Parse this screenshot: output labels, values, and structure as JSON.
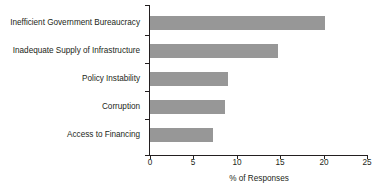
{
  "chart_data": {
    "type": "bar",
    "orientation": "horizontal",
    "title": "",
    "subtitle": "",
    "xlabel": "% of Responses",
    "ylabel": "",
    "xlim": [
      0,
      25
    ],
    "xticks": [
      0,
      5,
      10,
      15,
      20,
      25
    ],
    "xticklabels": [
      "0",
      "5",
      "10",
      "15",
      "20",
      "25"
    ],
    "grid": false,
    "legend": false,
    "categories": [
      "Inefficient Government Bureaucracy",
      "Inadequate Supply of Infrastructure",
      "Policy Instability",
      "Corruption",
      "Access to Financing"
    ],
    "values": [
      20.1,
      14.7,
      8.9,
      8.6,
      7.2
    ],
    "series": [
      {
        "name": "% of Responses",
        "values": [
          20.1,
          14.7,
          8.9,
          8.6,
          7.2
        ]
      }
    ],
    "colors": {
      "bar_fill": "#979797",
      "axis": "#231f20",
      "text": "#231f20",
      "background": "#ffffff"
    }
  }
}
